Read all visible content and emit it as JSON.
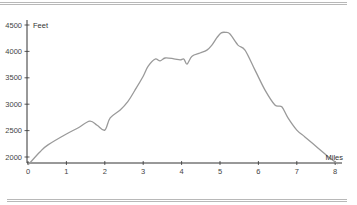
{
  "chart_data": {
    "type": "line",
    "title": "",
    "xlabel": "Miles",
    "ylabel": "Feet",
    "xlim": [
      0,
      8.15
    ],
    "ylim": [
      1700,
      4600
    ],
    "x_ticks": [
      0,
      1,
      2,
      3,
      4,
      5,
      6,
      7,
      8
    ],
    "y_ticks": [
      2000,
      2500,
      3000,
      3500,
      4000,
      4500
    ],
    "x_tick_labels": [
      "0",
      "1",
      "2",
      "3",
      "4",
      "5",
      "6",
      "7",
      "8"
    ],
    "y_tick_labels": [
      "2000",
      "2500",
      "3000",
      "3500",
      "4000",
      "4500"
    ],
    "grid": false,
    "legend": "none",
    "line_color": "#9a9a9a",
    "series": [
      {
        "name": "Elevation",
        "x": [
          0,
          0.31,
          0.52,
          1.0,
          1.3,
          1.61,
          1.8,
          2.0,
          2.14,
          2.4,
          2.6,
          2.79,
          3.0,
          3.13,
          3.31,
          3.44,
          3.57,
          3.8,
          3.96,
          4.06,
          4.14,
          4.27,
          4.48,
          4.66,
          4.79,
          4.92,
          5.03,
          5.15,
          5.26,
          5.47,
          5.65,
          5.91,
          6.17,
          6.43,
          6.61,
          6.77,
          7.0,
          7.21,
          7.55,
          7.86,
          8.07
        ],
        "y": [
          1850,
          2095,
          2230,
          2435,
          2550,
          2680,
          2600,
          2510,
          2740,
          2890,
          3050,
          3270,
          3530,
          3720,
          3855,
          3820,
          3875,
          3860,
          3840,
          3855,
          3760,
          3910,
          3970,
          4025,
          4120,
          4260,
          4350,
          4360,
          4330,
          4120,
          4025,
          3650,
          3270,
          2985,
          2950,
          2740,
          2510,
          2380,
          2170,
          1980,
          1870
        ]
      }
    ]
  }
}
